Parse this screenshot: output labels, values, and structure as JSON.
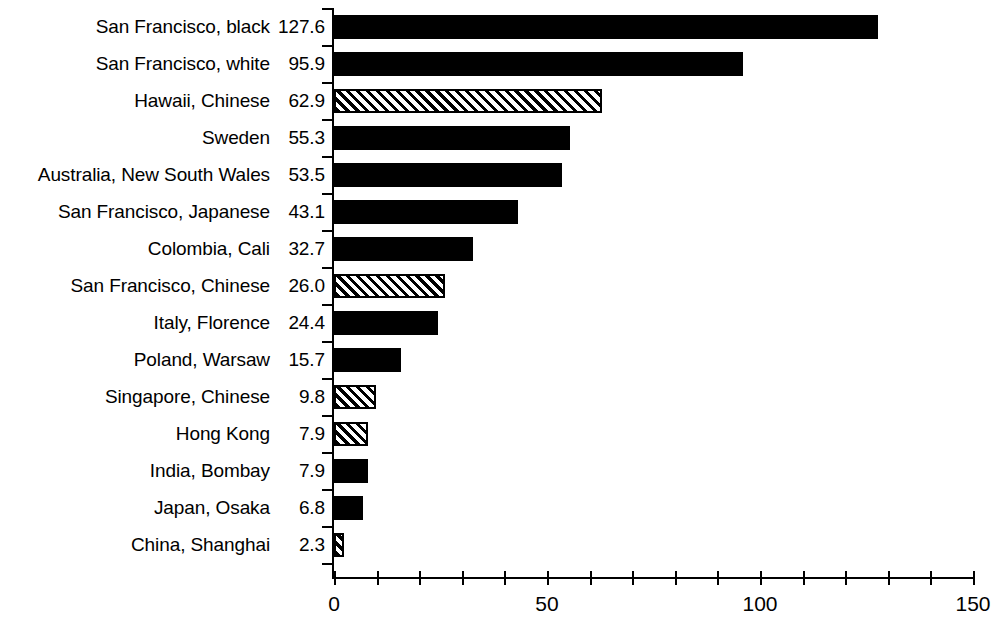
{
  "chart_data": {
    "type": "bar",
    "orientation": "horizontal",
    "title": "",
    "subtitle": "",
    "xlabel": "",
    "ylabel": "",
    "xlim": [
      0,
      150
    ],
    "x_ticks": [
      0,
      10,
      20,
      30,
      40,
      50,
      60,
      70,
      80,
      90,
      100,
      110,
      120,
      130,
      140,
      150
    ],
    "x_tick_labels": [
      {
        "value": 0,
        "label": "0"
      },
      {
        "value": 50,
        "label": "50"
      },
      {
        "value": 100,
        "label": "100"
      },
      {
        "value": 150,
        "label": "150"
      }
    ],
    "grid": false,
    "legend": false,
    "legend_position": "none",
    "value_labels_shown": true,
    "categories": [
      "San Francisco, black",
      "San Francisco, white",
      "Hawaii, Chinese",
      "Sweden",
      "Australia, New South Wales",
      "San Francisco, Japanese",
      "Colombia, Cali",
      "San Francisco, Chinese",
      "Italy, Florence",
      "Poland, Warsaw",
      "Singapore, Chinese",
      "Hong Kong",
      "India, Bombay",
      "Japan, Osaka",
      "China, Shanghai"
    ],
    "values": [
      127.6,
      95.9,
      62.9,
      55.3,
      53.5,
      43.1,
      32.7,
      26.0,
      24.4,
      15.7,
      9.8,
      7.9,
      7.9,
      6.8,
      2.3
    ],
    "bars": [
      {
        "label": "San Francisco, black",
        "value": 127.6,
        "value_text": "127.6",
        "fill": "solid"
      },
      {
        "label": "San Francisco, white",
        "value": 95.9,
        "value_text": "95.9",
        "fill": "solid"
      },
      {
        "label": "Hawaii, Chinese",
        "value": 62.9,
        "value_text": "62.9",
        "fill": "hatched"
      },
      {
        "label": "Sweden",
        "value": 55.3,
        "value_text": "55.3",
        "fill": "solid"
      },
      {
        "label": "Australia, New South Wales",
        "value": 53.5,
        "value_text": "53.5",
        "fill": "solid"
      },
      {
        "label": "San Francisco, Japanese",
        "value": 43.1,
        "value_text": "43.1",
        "fill": "solid"
      },
      {
        "label": "Colombia, Cali",
        "value": 32.7,
        "value_text": "32.7",
        "fill": "solid"
      },
      {
        "label": "San Francisco, Chinese",
        "value": 26.0,
        "value_text": "26.0",
        "fill": "hatched"
      },
      {
        "label": "Italy, Florence",
        "value": 24.4,
        "value_text": "24.4",
        "fill": "solid"
      },
      {
        "label": "Poland, Warsaw",
        "value": 15.7,
        "value_text": "15.7",
        "fill": "solid"
      },
      {
        "label": "Singapore, Chinese",
        "value": 9.8,
        "value_text": "9.8",
        "fill": "hatched"
      },
      {
        "label": "Hong Kong",
        "value": 7.9,
        "value_text": "7.9",
        "fill": "hatched"
      },
      {
        "label": "India, Bombay",
        "value": 7.9,
        "value_text": "7.9",
        "fill": "solid"
      },
      {
        "label": "Japan, Osaka",
        "value": 6.8,
        "value_text": "6.8",
        "fill": "solid"
      },
      {
        "label": "China, Shanghai",
        "value": 2.3,
        "value_text": "2.3",
        "fill": "hatched"
      }
    ],
    "colors": {
      "bar_solid": "#000000",
      "bar_hatch_stroke": "#000000",
      "bar_hatch_background": "#ffffff",
      "axis": "#000000",
      "text": "#000000",
      "background": "#ffffff"
    }
  }
}
